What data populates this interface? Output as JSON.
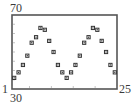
{
  "window_labels": {
    "ymax": "70",
    "xmin_left": "1",
    "ymin_bottom": "30",
    "xmax": "25"
  },
  "chart_data": {
    "type": "scatter",
    "title": "",
    "xlabel": "",
    "ylabel": "",
    "xlim": [
      1,
      25
    ],
    "ylim": [
      30,
      70
    ],
    "xscale": 5,
    "yscale": 5,
    "grid": false,
    "legend": null,
    "marker": "square",
    "x": [
      1,
      2,
      3,
      4,
      5,
      6,
      7,
      8,
      9,
      10,
      11,
      12,
      13,
      14,
      15,
      16,
      17,
      18,
      19,
      20,
      21,
      22,
      23,
      24
    ],
    "y": [
      36,
      39,
      43,
      48,
      55,
      58,
      63,
      62,
      56,
      50,
      43,
      39,
      36,
      39,
      43,
      48,
      55,
      58,
      63,
      62,
      56,
      50,
      43,
      39
    ],
    "series": [
      {
        "name": "data",
        "values": [
          36,
          39,
          43,
          48,
          55,
          58,
          63,
          62,
          56,
          50,
          43,
          39,
          36,
          39,
          43,
          48,
          55,
          58,
          63,
          62,
          56,
          50,
          43,
          39
        ]
      }
    ]
  },
  "colors": {
    "frame": "#555555",
    "marker": "#333333",
    "tick": "#888888"
  }
}
